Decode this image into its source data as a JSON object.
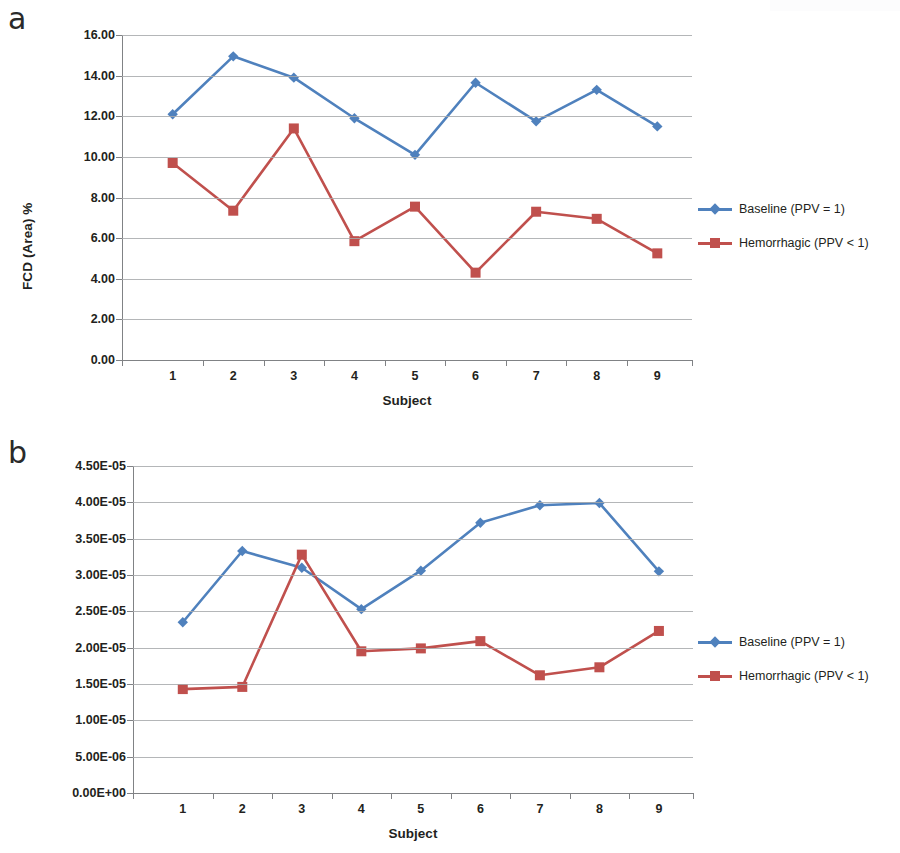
{
  "figure": {
    "panels": [
      {
        "letter": "a",
        "ylabel": "FCD (Area) %",
        "xlabel": "Subject",
        "yticks": [
          "0.00",
          "2.00",
          "4.00",
          "6.00",
          "8.00",
          "10.00",
          "12.00",
          "14.00",
          "16.00"
        ],
        "xticks": [
          "1",
          "2",
          "3",
          "4",
          "5",
          "6",
          "7",
          "8",
          "9"
        ],
        "legend": [
          {
            "label": "Baseline (PPV = 1)",
            "color": "#4f81bd",
            "marker": "diamond"
          },
          {
            "label": "Hemorrhagic (PPV < 1)",
            "color": "#c0504d",
            "marker": "square"
          }
        ]
      },
      {
        "letter": "b",
        "ylabel": "FCD (Length) mm/mm^2",
        "xlabel": "Subject",
        "yticks": [
          "0.00E+00",
          "5.00E-06",
          "1.00E-05",
          "1.50E-05",
          "2.00E-05",
          "2.50E-05",
          "3.00E-05",
          "3.50E-05",
          "4.00E-05",
          "4.50E-05"
        ],
        "xticks": [
          "1",
          "2",
          "3",
          "4",
          "5",
          "6",
          "7",
          "8",
          "9"
        ],
        "legend": [
          {
            "label": "Baseline (PPV = 1)",
            "color": "#4f81bd",
            "marker": "diamond"
          },
          {
            "label": "Hemorrhagic (PPV < 1)",
            "color": "#c0504d",
            "marker": "square"
          }
        ]
      }
    ]
  },
  "chart_data": [
    {
      "type": "line",
      "panel": "a",
      "title": "",
      "xlabel": "Subject",
      "ylabel": "FCD (Area) %",
      "categories": [
        "1",
        "2",
        "3",
        "4",
        "5",
        "6",
        "7",
        "8",
        "9"
      ],
      "x": [
        1,
        2,
        3,
        4,
        5,
        6,
        7,
        8,
        9
      ],
      "ylim": [
        0,
        16
      ],
      "ytick_values": [
        0,
        2,
        4,
        6,
        8,
        10,
        12,
        14,
        16
      ],
      "ytick_labels": [
        "0.00",
        "2.00",
        "4.00",
        "6.00",
        "8.00",
        "10.00",
        "12.00",
        "14.00",
        "16.00"
      ],
      "grid": true,
      "legend_position": "right",
      "series": [
        {
          "name": "Baseline (PPV = 1)",
          "color": "#4f81bd",
          "marker": "diamond",
          "values": [
            12.1,
            14.95,
            13.9,
            11.9,
            10.1,
            13.65,
            11.75,
            13.3,
            11.5
          ]
        },
        {
          "name": "Hemorrhagic (PPV < 1)",
          "color": "#c0504d",
          "marker": "square",
          "values": [
            9.7,
            7.35,
            11.4,
            5.85,
            7.55,
            4.3,
            7.3,
            6.95,
            5.25
          ]
        }
      ]
    },
    {
      "type": "line",
      "panel": "b",
      "title": "",
      "xlabel": "Subject",
      "ylabel": "FCD (Length) mm/mm^2",
      "categories": [
        "1",
        "2",
        "3",
        "4",
        "5",
        "6",
        "7",
        "8",
        "9"
      ],
      "x": [
        1,
        2,
        3,
        4,
        5,
        6,
        7,
        8,
        9
      ],
      "ylim": [
        0,
        4.5e-05
      ],
      "ytick_values": [
        0,
        5e-06,
        1e-05,
        1.5e-05,
        2e-05,
        2.5e-05,
        3e-05,
        3.5e-05,
        4e-05,
        4.5e-05
      ],
      "ytick_labels": [
        "0.00E+00",
        "5.00E-06",
        "1.00E-05",
        "1.50E-05",
        "2.00E-05",
        "2.50E-05",
        "3.00E-05",
        "3.50E-05",
        "4.00E-05",
        "4.50E-05"
      ],
      "grid": true,
      "legend_position": "right",
      "series": [
        {
          "name": "Baseline (PPV = 1)",
          "color": "#4f81bd",
          "marker": "diamond",
          "values": [
            2.35e-05,
            3.33e-05,
            3.1e-05,
            2.53e-05,
            3.06e-05,
            3.72e-05,
            3.96e-05,
            3.99e-05,
            3.05e-05
          ]
        },
        {
          "name": "Hemorrhagic (PPV < 1)",
          "color": "#c0504d",
          "marker": "square",
          "values": [
            1.43e-05,
            1.46e-05,
            3.28e-05,
            1.95e-05,
            1.99e-05,
            2.09e-05,
            1.62e-05,
            1.73e-05,
            2.23e-05
          ]
        }
      ]
    }
  ]
}
